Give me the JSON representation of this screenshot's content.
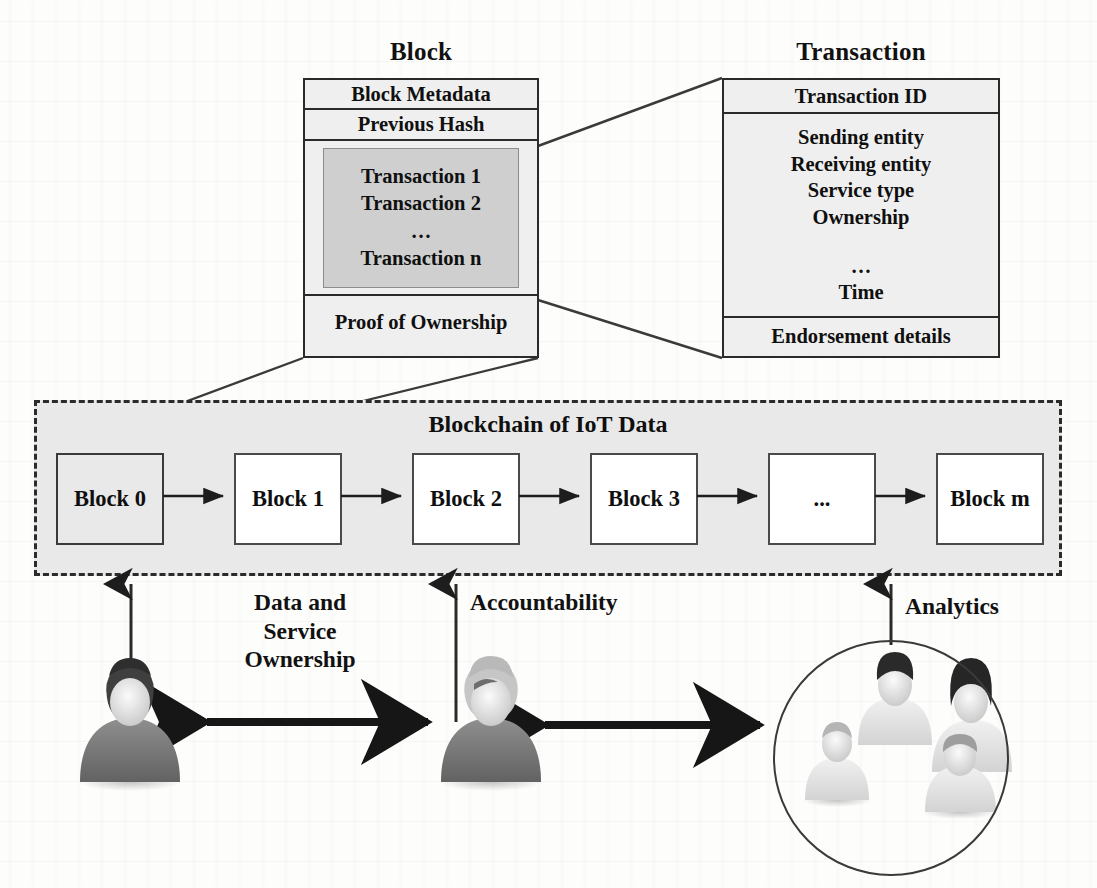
{
  "diagram": {
    "title_block": "Block",
    "title_transaction": "Transaction"
  },
  "block": {
    "rows": [
      {
        "label": "Block Metadata"
      },
      {
        "label": "Previous Hash"
      }
    ],
    "transactions": [
      "Transaction 1",
      "Transaction 2",
      "…",
      "Transaction n"
    ],
    "footer": "Proof of Ownership"
  },
  "transaction": {
    "header": "Transaction ID",
    "fields": [
      "Sending entity",
      "Receiving entity",
      "Service type",
      "Ownership",
      "…",
      "Time"
    ],
    "footer": "Endorsement details"
  },
  "chain": {
    "title": "Blockchain of IoT Data",
    "blocks": [
      {
        "label": "Block 0"
      },
      {
        "label": "Block 1"
      },
      {
        "label": "Block 2"
      },
      {
        "label": "Block 3"
      },
      {
        "label": "..."
      },
      {
        "label": "Block m"
      }
    ]
  },
  "captions": {
    "ownership_line1": "Data and",
    "ownership_line2": "Service",
    "ownership_line3": "Ownership",
    "accountability": "Accountability",
    "analytics": "Analytics"
  },
  "colors": {
    "ink": "#111111",
    "box_fill": "#efefef",
    "tx_inner_fill": "#cfcfcf",
    "chain_fill": "#e9e9e9",
    "border": "#2a2a2a",
    "block_border": "#4a4a4a",
    "page": "#fdfdfc"
  },
  "icons": {
    "person_dark": "person-dark-icon",
    "person_light": "person-light-icon",
    "arrow_right": "arrow-right-icon",
    "arrow_up": "arrow-up-icon",
    "arrow_double": "arrow-double-headed-icon"
  }
}
